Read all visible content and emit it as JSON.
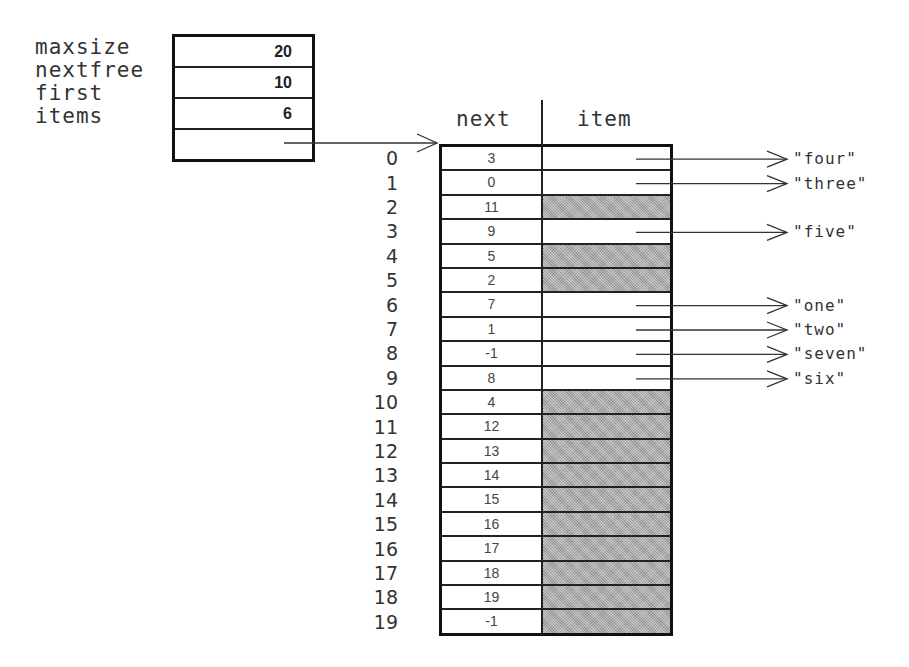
{
  "struct": {
    "fields": [
      {
        "name": "maxsize",
        "value": "20"
      },
      {
        "name": "nextfree",
        "value": "10"
      },
      {
        "name": "first",
        "value": "6"
      },
      {
        "name": "items",
        "value": ""
      }
    ]
  },
  "table": {
    "headers": {
      "next": "next",
      "item": "item"
    },
    "rows": [
      {
        "index": "0",
        "next": "3",
        "item": "\"four\"",
        "filled": true
      },
      {
        "index": "1",
        "next": "0",
        "item": "\"three\"",
        "filled": true
      },
      {
        "index": "2",
        "next": "11",
        "item": "",
        "filled": false
      },
      {
        "index": "3",
        "next": "9",
        "item": "\"five\"",
        "filled": true
      },
      {
        "index": "4",
        "next": "5",
        "item": "",
        "filled": false
      },
      {
        "index": "5",
        "next": "2",
        "item": "",
        "filled": false
      },
      {
        "index": "6",
        "next": "7",
        "item": "\"one\"",
        "filled": true
      },
      {
        "index": "7",
        "next": "1",
        "item": "\"two\"",
        "filled": true
      },
      {
        "index": "8",
        "next": "-1",
        "item": "\"seven\"",
        "filled": true
      },
      {
        "index": "9",
        "next": "8",
        "item": "\"six\"",
        "filled": true
      },
      {
        "index": "10",
        "next": "4",
        "item": "",
        "filled": false
      },
      {
        "index": "11",
        "next": "12",
        "item": "",
        "filled": false
      },
      {
        "index": "12",
        "next": "13",
        "item": "",
        "filled": false
      },
      {
        "index": "13",
        "next": "14",
        "item": "",
        "filled": false
      },
      {
        "index": "14",
        "next": "15",
        "item": "",
        "filled": false
      },
      {
        "index": "15",
        "next": "16",
        "item": "",
        "filled": false
      },
      {
        "index": "16",
        "next": "17",
        "item": "",
        "filled": false
      },
      {
        "index": "17",
        "next": "18",
        "item": "",
        "filled": false
      },
      {
        "index": "18",
        "next": "19",
        "item": "",
        "filled": false
      },
      {
        "index": "19",
        "next": "-1",
        "item": "",
        "filled": false
      }
    ]
  },
  "colors": {
    "line": "#222222",
    "empty_fill": "#a8a8a8",
    "background": "#ffffff"
  }
}
